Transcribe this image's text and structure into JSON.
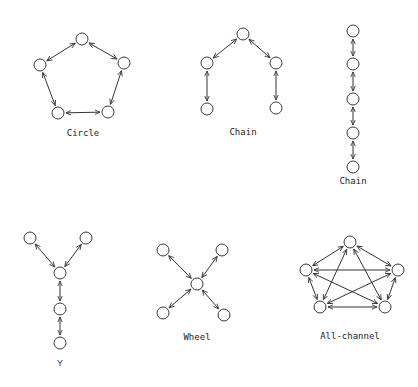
{
  "networks": [
    {
      "id": "circle",
      "label": "Circle",
      "label_pos": [
        83,
        136
      ],
      "nodes": [
        [
          82,
          39
        ],
        [
          124,
          63
        ],
        [
          108,
          112
        ],
        [
          58,
          113
        ],
        [
          40,
          65
        ]
      ],
      "edges": [
        [
          0,
          1
        ],
        [
          1,
          2
        ],
        [
          2,
          3
        ],
        [
          3,
          4
        ],
        [
          4,
          0
        ]
      ]
    },
    {
      "id": "chain-arch",
      "label": "Chain",
      "label_pos": [
        243,
        135
      ],
      "nodes": [
        [
          243,
          34
        ],
        [
          207,
          63
        ],
        [
          276,
          63
        ],
        [
          207,
          109
        ],
        [
          276,
          108
        ]
      ],
      "edges": [
        [
          0,
          1
        ],
        [
          0,
          2
        ],
        [
          1,
          3
        ],
        [
          2,
          4
        ]
      ]
    },
    {
      "id": "chain-vertical",
      "label": "Chain",
      "label_pos": [
        353,
        184
      ],
      "nodes": [
        [
          353,
          31
        ],
        [
          353,
          64
        ],
        [
          353,
          99
        ],
        [
          353,
          133
        ],
        [
          353,
          167
        ]
      ],
      "edges": [
        [
          0,
          1
        ],
        [
          1,
          2
        ],
        [
          2,
          3
        ],
        [
          3,
          4
        ]
      ]
    },
    {
      "id": "y",
      "label": "Y",
      "label_pos": [
        60,
        366
      ],
      "nodes": [
        [
          30,
          238
        ],
        [
          86,
          238
        ],
        [
          60,
          273
        ],
        [
          60,
          309
        ],
        [
          60,
          343
        ]
      ],
      "edges": [
        [
          0,
          2
        ],
        [
          1,
          2
        ],
        [
          2,
          3
        ],
        [
          3,
          4
        ]
      ]
    },
    {
      "id": "wheel",
      "label": "Wheel",
      "label_pos": [
        197,
        340
      ],
      "nodes": [
        [
          197,
          284
        ],
        [
          163,
          250
        ],
        [
          222,
          250
        ],
        [
          163,
          313
        ],
        [
          224,
          315
        ]
      ],
      "edges": [
        [
          0,
          1
        ],
        [
          0,
          2
        ],
        [
          0,
          3
        ],
        [
          0,
          4
        ]
      ]
    },
    {
      "id": "all-channel",
      "label": "All-channel",
      "label_pos": [
        350,
        339
      ],
      "nodes": [
        [
          350,
          242
        ],
        [
          398,
          270
        ],
        [
          385,
          307
        ],
        [
          320,
          307
        ],
        [
          306,
          270
        ]
      ],
      "edges": [
        [
          0,
          1
        ],
        [
          0,
          2
        ],
        [
          0,
          3
        ],
        [
          0,
          4
        ],
        [
          1,
          2
        ],
        [
          1,
          3
        ],
        [
          1,
          4
        ],
        [
          2,
          3
        ],
        [
          2,
          4
        ],
        [
          3,
          4
        ]
      ]
    }
  ],
  "style": {
    "node_radius": 6,
    "stroke_color": "#333333",
    "background": "#ffffff"
  }
}
